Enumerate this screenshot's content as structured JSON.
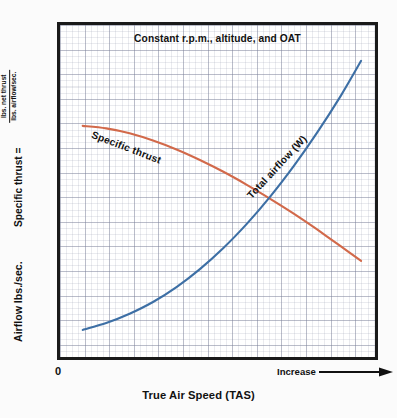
{
  "chart_data": {
    "type": "line",
    "title": "Constant r.p.m., altitude, and OAT",
    "xlabel": "True Air Speed (TAS)",
    "ylabel": "Airflow lbs./sec.   Specific thrust =",
    "ylabel_parts": {
      "airflow": "Airflow lbs./sec.",
      "specific_thrust": "Specific thrust =",
      "fraction_numerator": "lbs. net thrust",
      "fraction_denominator": "lbs. airflow/sec."
    },
    "x_tick_labels": [
      "0",
      "Increase"
    ],
    "x_axis_direction_arrow": true,
    "grid": true,
    "grid_major_spacing": 4,
    "legend_position": "inline-curve-labels",
    "xlim": [
      0,
      100
    ],
    "ylim": [
      0,
      100
    ],
    "series": [
      {
        "name": "Specific thrust",
        "color": "#D2694A",
        "label_rotation_deg": 21,
        "x": [
          4,
          12,
          20,
          28,
          36,
          44,
          52,
          60,
          68,
          76,
          84,
          92,
          99
        ],
        "y": [
          71.0,
          70.2,
          68.6,
          66.3,
          63.4,
          60.0,
          56.2,
          52.0,
          47.5,
          42.7,
          37.6,
          32.2,
          27.5
        ]
      },
      {
        "name": "Total airflow (W)",
        "color": "#3D6FA5",
        "label_rotation_deg": -47,
        "x": [
          4,
          12,
          20,
          28,
          36,
          44,
          52,
          60,
          68,
          76,
          84,
          92,
          99
        ],
        "y": [
          5.2,
          7.4,
          10.4,
          14.2,
          19.0,
          24.8,
          31.6,
          39.4,
          48.2,
          58.0,
          68.8,
          80.6,
          92.0
        ]
      }
    ]
  },
  "chart": {
    "title": "Constant r.p.m., altitude, and OAT",
    "x_axis": {
      "zero_label": "0",
      "increase_label": "Increase",
      "title": "True Air Speed (TAS)"
    },
    "y_axis": {
      "airflow_label": "Airflow lbs./sec.",
      "specific_thrust_label": "Specific thrust =",
      "fraction_numerator": "lbs. net thrust",
      "fraction_denominator": "lbs. airflow/sec."
    },
    "curves": {
      "specific_thrust_label": "Specific thrust",
      "total_airflow_label": "Total airflow (W)"
    },
    "colors": {
      "specific_thrust": "#D2694A",
      "total_airflow": "#3D6FA5",
      "frame": "#1A1A1A",
      "grid_major": "#787D96",
      "grid_minor": "#969BAF",
      "background": "#FBFBFB"
    }
  }
}
